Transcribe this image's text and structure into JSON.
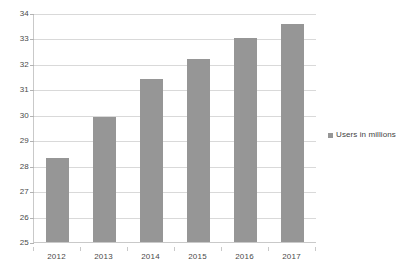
{
  "chart_data": {
    "type": "bar",
    "title": "",
    "subtitle": "",
    "xlabel": "",
    "ylabel": "",
    "categories": [
      "2012",
      "2013",
      "2014",
      "2015",
      "2016",
      "2017"
    ],
    "values": [
      28.3,
      29.9,
      31.4,
      32.2,
      33.0,
      33.55
    ],
    "series": [
      {
        "name": "Users in millions",
        "values": [
          28.3,
          29.9,
          31.4,
          32.2,
          33.0,
          33.55
        ]
      }
    ],
    "ylim": [
      25,
      34
    ],
    "ytick_labels": [
      "34",
      "33",
      "32",
      "31",
      "30",
      "29",
      "28",
      "27",
      "26",
      "25"
    ],
    "ytick_values": [
      34,
      33,
      32,
      31,
      30,
      29,
      28,
      27,
      26,
      25
    ],
    "ystep": 1,
    "grid": true,
    "grid_axis": "y",
    "legend": {
      "visible": true,
      "position": "right",
      "entries": [
        {
          "label": "Users in millions",
          "color": "#969696",
          "marker": "square"
        }
      ]
    },
    "colors": {
      "bar": "#969696",
      "gridline": "#d9d9d9",
      "axis": "#c9c9c9",
      "text": "#4a4a4a",
      "background": "#ffffff"
    }
  }
}
